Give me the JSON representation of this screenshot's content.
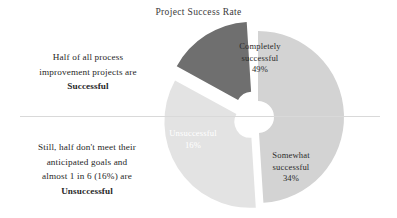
{
  "title": "Project Success Rate",
  "captions": {
    "top": {
      "lines": [
        "Half of all process",
        "improvement projects are"
      ],
      "emphasis": "Successful"
    },
    "bottom": {
      "lines": [
        "Still, half don't meet their",
        "anticipated  goals and",
        "almost 1 in 6 (16%) are"
      ],
      "emphasis": "Unsuccessful"
    }
  },
  "chart_data": {
    "type": "pie",
    "title": "Project Success Rate",
    "variant": "donut-exploded",
    "legend": "none",
    "labels_inside": true,
    "categories": [
      "Completely successful",
      "Somewhat successful",
      "Unsuccessful"
    ],
    "values": [
      49,
      34,
      16
    ],
    "value_labels": [
      "49%",
      "34%",
      "16%"
    ],
    "colors": [
      "#d3d3d3",
      "#e3e3e3",
      "#6f6f6f"
    ],
    "label_colors": [
      "#2b2b2b",
      "#2b2b2b",
      "#ffffff"
    ],
    "start_angle_deg": -90,
    "direction": "clockwise",
    "exploded": [
      false,
      true,
      true
    ],
    "center": [
      258,
      117
    ],
    "outer_radius": 86,
    "inner_radius": 16,
    "slices": [
      {
        "name": "Completely successful",
        "value": 49,
        "label": "49%",
        "color": "#d3d3d3",
        "start_deg": -90,
        "end_deg": 86.4,
        "explode": 0
      },
      {
        "name": "Somewhat successful",
        "value": 34,
        "label": "34%",
        "color": "#e3e3e3",
        "start_deg": 86.4,
        "end_deg": 208.8,
        "explode": 9
      },
      {
        "name": "Unsuccessful",
        "value": 16,
        "label": "16%",
        "color": "#6f6f6f",
        "start_deg": 208.8,
        "end_deg": 266.4,
        "explode": 11
      }
    ]
  },
  "slice_labels": {
    "completely": {
      "name_line1": "Completely",
      "name_line2": "successful",
      "pct": "49%"
    },
    "somewhat": {
      "name_line1": "Somewhat",
      "name_line2": "successful",
      "pct": "34%"
    },
    "unsuccessful": {
      "name_line1": "Unsuccessful",
      "pct": "16%"
    }
  }
}
